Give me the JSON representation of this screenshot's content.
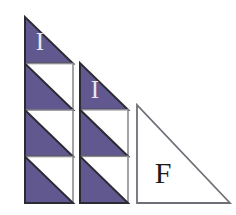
{
  "figure": {
    "canvas": {
      "width": 236,
      "height": 215,
      "background": "#ffffff"
    },
    "colors": {
      "fill_purple": "#615890",
      "fill_white": "#ffffff",
      "outline_dark": "#2b2b33",
      "outline_gray": "#8b8b93",
      "label_light": "#e8e7ef",
      "label_dark": "#1c1c1c"
    },
    "baseline_y": 203,
    "shapes": [
      {
        "id": "column-1",
        "name": "stepped-triangle-left",
        "label": "I",
        "label_x": 40,
        "label_y": 50,
        "label_color": "#e8e7ef",
        "label_size": 25,
        "x_left": 25,
        "x_right": 73,
        "y_top": 17,
        "y_bottom": 203,
        "cell_count": 4,
        "cell_height": 46.5,
        "cells": [
          {
            "index": 0,
            "type": "triangle",
            "y_top": 17,
            "y_bottom": 63.5,
            "fill": "#615890"
          },
          {
            "index": 1,
            "type": "split-square",
            "y_top": 63.5,
            "y_bottom": 110,
            "fill": "#615890"
          },
          {
            "index": 2,
            "type": "split-square",
            "y_top": 110,
            "y_bottom": 156.5,
            "fill": "#615890"
          },
          {
            "index": 3,
            "type": "split-square",
            "y_top": 156.5,
            "y_bottom": 203,
            "fill": "#615890"
          }
        ]
      },
      {
        "id": "column-2",
        "name": "stepped-triangle-middle",
        "label": "I",
        "label_x": 95,
        "label_y": 98,
        "label_color": "#e8e7ef",
        "label_size": 25,
        "x_left": 80,
        "x_right": 128,
        "y_top": 63,
        "y_bottom": 203,
        "cell_count": 3,
        "cell_height": 46.7,
        "cells": [
          {
            "index": 0,
            "type": "triangle",
            "y_top": 63,
            "y_bottom": 109.7,
            "fill": "#615890"
          },
          {
            "index": 1,
            "type": "split-square",
            "y_top": 109.7,
            "y_bottom": 156.3,
            "fill": "#615890"
          },
          {
            "index": 2,
            "type": "split-square",
            "y_top": 156.3,
            "y_bottom": 203,
            "fill": "#615890"
          }
        ]
      },
      {
        "id": "triangle-f",
        "name": "large-white-triangle",
        "label": "F",
        "label_x": 163,
        "label_y": 183,
        "label_color": "#1c1c1c",
        "label_size": 30,
        "x_left": 137,
        "x_right": 230,
        "y_top": 105,
        "y_bottom": 203,
        "fill": "#ffffff"
      }
    ]
  }
}
